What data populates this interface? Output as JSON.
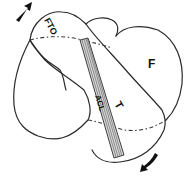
{
  "diagram": {
    "labels": {
      "upper_bone": "F",
      "lower_bone": "T",
      "band": "ACL",
      "top_label": "FTO"
    },
    "arrows": [
      {
        "position": "top-left",
        "direction": "up-right"
      },
      {
        "position": "bottom-right",
        "direction": "down-left"
      }
    ],
    "colors": {
      "line": "#2a2a2a",
      "band_fill": "#d8d8d8",
      "background": "#ffffff"
    }
  }
}
